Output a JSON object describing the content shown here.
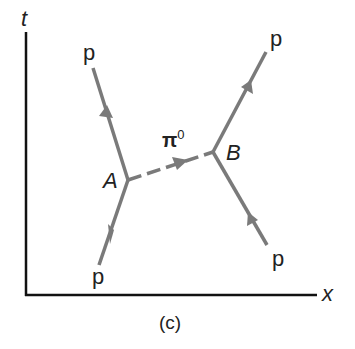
{
  "diagram": {
    "type": "spacetime-feynman-diagram",
    "caption": "(c)",
    "axes": {
      "vertical_label": "t",
      "horizontal_label": "x"
    },
    "vertices": [
      {
        "id": "A",
        "label": "A"
      },
      {
        "id": "B",
        "label": "B"
      }
    ],
    "exchange_particle": {
      "label": "π⁰",
      "base": "π",
      "superscript": "0",
      "from": "A",
      "to": "B",
      "style": "dashed"
    },
    "particles": [
      {
        "label": "p",
        "role": "incoming",
        "vertex": "A"
      },
      {
        "label": "p",
        "role": "outgoing",
        "vertex": "A"
      },
      {
        "label": "p",
        "role": "incoming",
        "vertex": "B"
      },
      {
        "label": "p",
        "role": "outgoing",
        "vertex": "B"
      }
    ],
    "colors": {
      "axis": "#111111",
      "line": "#7a7a7a",
      "text": "#222222"
    }
  }
}
